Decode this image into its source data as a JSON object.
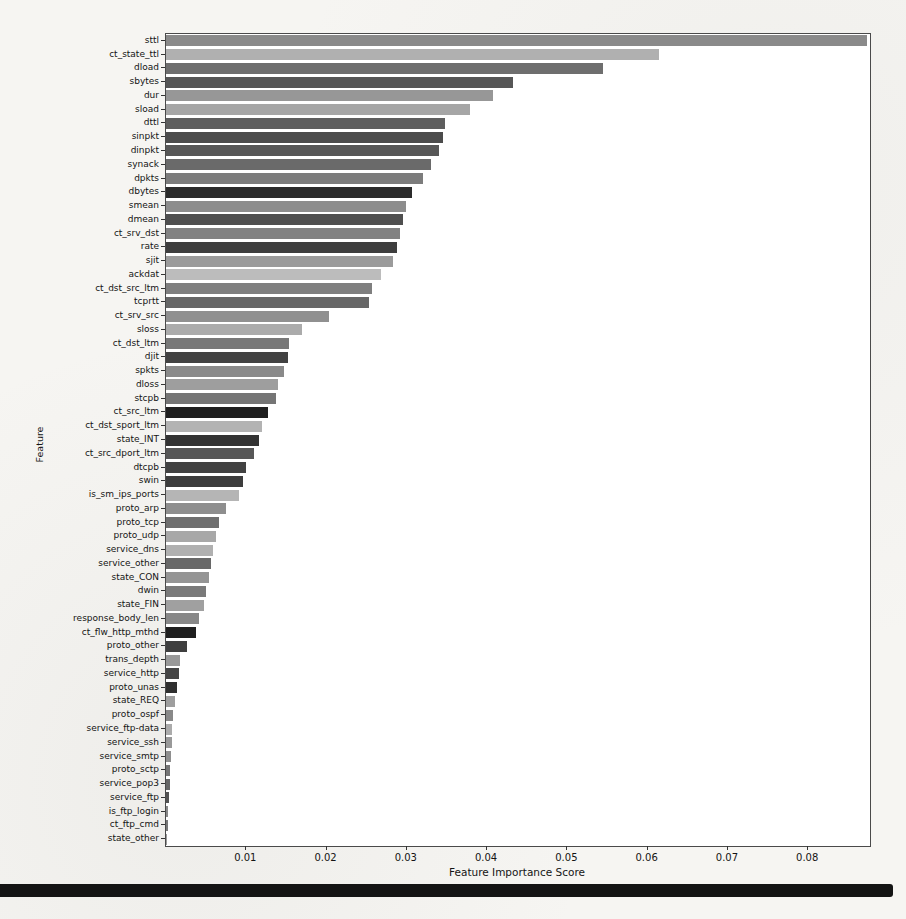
{
  "chart_data": {
    "type": "bar",
    "orientation": "horizontal",
    "title": "",
    "xlabel": "Feature Importance Score",
    "ylabel": "Feature",
    "xlim": [
      0,
      0.0877
    ],
    "x_ticks": [
      "0.01",
      "0.02",
      "0.03",
      "0.04",
      "0.05",
      "0.06",
      "0.07",
      "0.08"
    ],
    "x_tick_values": [
      0.01,
      0.02,
      0.03,
      0.04,
      0.05,
      0.06,
      0.07,
      0.08
    ],
    "grid": false,
    "legend": null,
    "categories": [
      "sttl",
      "ct_state_ttl",
      "dload",
      "sbytes",
      "dur",
      "sload",
      "dttl",
      "sinpkt",
      "dinpkt",
      "synack",
      "dpkts",
      "dbytes",
      "smean",
      "dmean",
      "ct_srv_dst",
      "rate",
      "sjit",
      "ackdat",
      "ct_dst_src_ltm",
      "tcprtt",
      "ct_srv_src",
      "sloss",
      "ct_dst_ltm",
      "djit",
      "spkts",
      "dloss",
      "stcpb",
      "ct_src_ltm",
      "ct_dst_sport_ltm",
      "state_INT",
      "ct_src_dport_ltm",
      "dtcpb",
      "swin",
      "is_sm_ips_ports",
      "proto_arp",
      "proto_tcp",
      "proto_udp",
      "service_dns",
      "service_other",
      "state_CON",
      "dwin",
      "state_FIN",
      "response_body_len",
      "ct_flw_http_mthd",
      "proto_other",
      "trans_depth",
      "service_http",
      "proto_unas",
      "state_REQ",
      "proto_ospf",
      "service_ftp-data",
      "service_ssh",
      "service_smtp",
      "proto_sctp",
      "service_pop3",
      "service_ftp",
      "is_ftp_login",
      "ct_ftp_cmd",
      "state_other"
    ],
    "values": [
      0.0873,
      0.0614,
      0.0545,
      0.0432,
      0.0407,
      0.0379,
      0.0347,
      0.0345,
      0.034,
      0.033,
      0.032,
      0.0306,
      0.0299,
      0.0295,
      0.0291,
      0.0288,
      0.0283,
      0.0268,
      0.0256,
      0.0253,
      0.0203,
      0.0169,
      0.0153,
      0.0152,
      0.0147,
      0.0139,
      0.0137,
      0.0127,
      0.012,
      0.0116,
      0.011,
      0.01,
      0.0096,
      0.0091,
      0.0075,
      0.0066,
      0.0062,
      0.0059,
      0.0056,
      0.0054,
      0.005,
      0.0047,
      0.0041,
      0.0037,
      0.0026,
      0.0017,
      0.0016,
      0.0014,
      0.0011,
      0.0009,
      0.0008,
      0.0007,
      0.0006,
      0.0005,
      0.00045,
      0.0004,
      0.0003,
      0.0002,
      0.0001
    ],
    "bar_colors": [
      "#8a8a8a",
      "#b0b0b0",
      "#6e6e6e",
      "#565656",
      "#979797",
      "#a6a6a6",
      "#5e5e5e",
      "#4c4c4c",
      "#575757",
      "#6a6a6a",
      "#7c7c7c",
      "#2b2b2b",
      "#8d8d8d",
      "#4f4f4f",
      "#828282",
      "#3e3e3e",
      "#9b9b9b",
      "#bcbcbc",
      "#7f7f7f",
      "#676767",
      "#909090",
      "#ababab",
      "#787878",
      "#424242",
      "#8a8a8a",
      "#9e9e9e",
      "#757575",
      "#1f1f1f",
      "#b3b3b3",
      "#333333",
      "#575757",
      "#424242",
      "#3d3d3d",
      "#b5b5b5",
      "#8e8e8e",
      "#6f6f6f",
      "#a8a8a8",
      "#b0b0b0",
      "#686868",
      "#959595",
      "#7a7a7a",
      "#a0a0a0",
      "#888888",
      "#1f1f1f",
      "#3f3f3f",
      "#999999",
      "#454545",
      "#2f2f2f",
      "#9e9e9e",
      "#898989",
      "#ababab",
      "#999999",
      "#8f8f8f",
      "#767676",
      "#666666",
      "#525252",
      "#888888",
      "#787878",
      "#999999"
    ]
  }
}
